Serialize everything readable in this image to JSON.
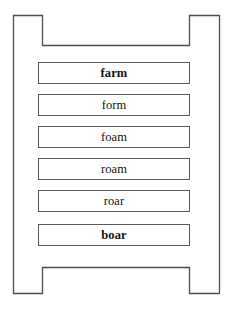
{
  "diagram": {
    "type": "word-ladder",
    "frame": {
      "name": "ladder-frame",
      "stroke_color": "#4d4d4d",
      "fill_color": "#ffffff"
    },
    "rung_style": {
      "stroke_color": "#595959",
      "fill_color": "#ffffff",
      "text_color": "#121212"
    },
    "rungs": [
      {
        "word": "farm",
        "weight": "bold",
        "top": 62
      },
      {
        "word": "form",
        "weight": "normal",
        "top": 94
      },
      {
        "word": "foam",
        "weight": "normal",
        "top": 126
      },
      {
        "word": "roam",
        "weight": "normal",
        "top": 158
      },
      {
        "word": "roar",
        "weight": "normal",
        "top": 190
      },
      {
        "word": "boar",
        "weight": "bold",
        "top": 224
      }
    ]
  }
}
